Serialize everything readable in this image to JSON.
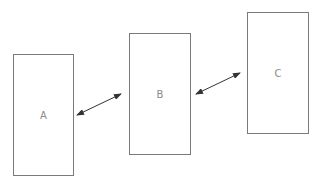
{
  "diagram": {
    "boxes": [
      {
        "id": "A",
        "label": "A",
        "x": 13,
        "y": 54,
        "w": 61,
        "h": 122
      },
      {
        "id": "B",
        "label": "B",
        "x": 129,
        "y": 33,
        "w": 62,
        "h": 122
      },
      {
        "id": "C",
        "label": "C",
        "x": 247,
        "y": 12,
        "w": 62,
        "h": 122
      }
    ],
    "connectors": [
      {
        "from": "A",
        "to": "B",
        "type": "bidirectional-arrow",
        "x1": 77,
        "y1": 115,
        "x2": 121,
        "y2": 94
      },
      {
        "from": "B",
        "to": "C",
        "type": "bidirectional-arrow",
        "x1": 196,
        "y1": 94,
        "x2": 240,
        "y2": 73
      }
    ],
    "colors": {
      "box_border": "#7a7a7a",
      "label_text": "#8a8a8a",
      "arrow": "#333333"
    }
  }
}
